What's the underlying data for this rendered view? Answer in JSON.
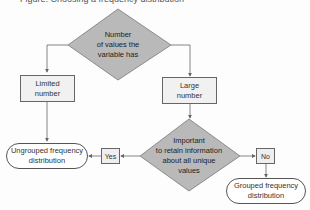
{
  "header": {
    "cut_off_title": "Figure: Choosing a frequency distribution"
  },
  "nodes": {
    "decision_1": {
      "text": [
        "Number",
        "of values the",
        "variable has"
      ]
    },
    "limited": {
      "text": [
        "Limited",
        "number"
      ]
    },
    "large": {
      "text": [
        "Large",
        "number"
      ]
    },
    "decision_2": {
      "text": [
        "Important",
        "to retain information",
        "about all unique",
        "values"
      ]
    },
    "yes": {
      "text": "Yes"
    },
    "no": {
      "text": "No"
    },
    "ungrouped": {
      "text": [
        "Ungrouped frequency",
        "distribution"
      ]
    },
    "grouped": {
      "text": [
        "Grouped frequency",
        "distribution"
      ]
    }
  },
  "colors": {
    "diamond_fill": "#b9b9b9",
    "box_fill": "#f1f1f1",
    "line": "#666666"
  }
}
